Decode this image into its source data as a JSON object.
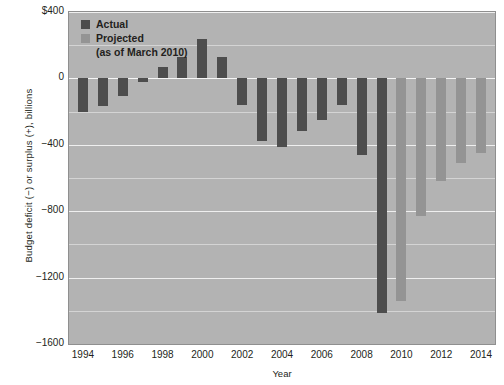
{
  "chart_data": {
    "type": "bar",
    "title": "",
    "xlabel": "Year",
    "ylabel": "Budget deficit (−) or surplus (+), billions",
    "ylim": [
      -1600,
      400
    ],
    "yticks": [
      400,
      0,
      -400,
      -800,
      -1200,
      -1600
    ],
    "ytick_labels": [
      "$400",
      "0",
      "−400",
      "−800",
      "−1200",
      "−1600"
    ],
    "grid": true,
    "legend_position": "top-left",
    "legend": [
      {
        "label": "Actual",
        "color": "#4d4d4d",
        "key": "actual"
      },
      {
        "label": "Projected",
        "color": "#949494",
        "key": "projected"
      }
    ],
    "legend_note": "(as of March 2010)",
    "xlim": [
      1993.3,
      2014.7
    ],
    "xticks": [
      1994,
      1996,
      1998,
      2000,
      2002,
      2004,
      2006,
      2008,
      2010,
      2012,
      2014
    ],
    "xtick_labels": [
      "1994",
      "1996",
      "1998",
      "2000",
      "2002",
      "2004",
      "2006",
      "2008",
      "2010",
      "2012",
      "2014"
    ],
    "categories": [
      1994,
      1995,
      1996,
      1997,
      1998,
      1999,
      2000,
      2001,
      2002,
      2003,
      2004,
      2005,
      2006,
      2007,
      2008,
      2009,
      2010,
      2011,
      2012,
      2013,
      2014
    ],
    "values": [
      -203,
      -164,
      -107,
      -22,
      69,
      126,
      236,
      128,
      -158,
      -378,
      -413,
      -318,
      -248,
      -161,
      -459,
      -1413,
      -1341,
      -828,
      -617,
      -512,
      -452
    ],
    "series_key": [
      "actual",
      "actual",
      "actual",
      "actual",
      "actual",
      "actual",
      "actual",
      "actual",
      "actual",
      "actual",
      "actual",
      "actual",
      "actual",
      "actual",
      "actual",
      "actual",
      "projected",
      "projected",
      "projected",
      "projected",
      "projected"
    ]
  }
}
